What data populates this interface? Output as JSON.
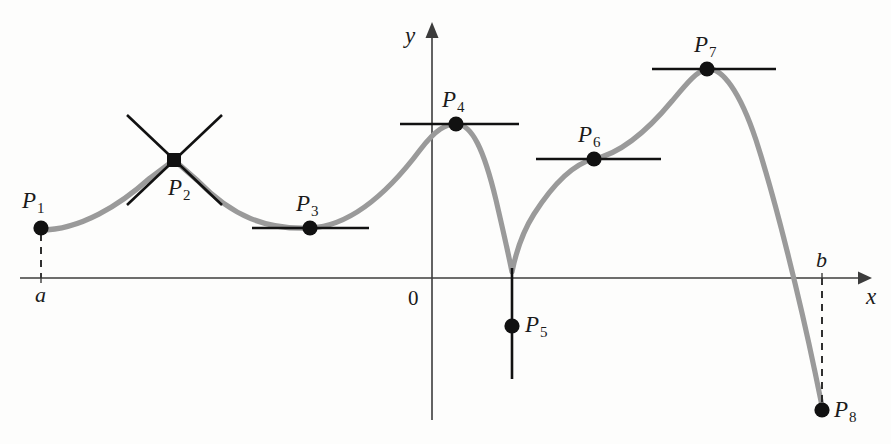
{
  "figure": {
    "background_color": "#fdfdfc",
    "curve_color": "#9a9a9a",
    "axis_color": "#3c3c3c",
    "marker_color": "#111111",
    "tangent_color": "#111111"
  },
  "axes": {
    "x_label": "x",
    "y_label": "y",
    "origin_label": "0",
    "x_axis_y": 278,
    "y_axis_x": 432,
    "left_endpoint_label": "a",
    "right_endpoint_label": "b"
  },
  "points": [
    {
      "label": "P",
      "sub": "1",
      "name": "p1",
      "x": 41,
      "y": 228,
      "kind": "left-endpoint",
      "tangent": "none",
      "label_x": 22,
      "label_y": 189
    },
    {
      "label": "P",
      "sub": "2",
      "name": "p2",
      "x": 174,
      "y": 160,
      "kind": "corner",
      "tangent": "crossing",
      "label_x": 168,
      "label_y": 176
    },
    {
      "label": "P",
      "sub": "3",
      "name": "p3",
      "x": 310,
      "y": 228,
      "kind": "local-minimum",
      "tangent": "horizontal",
      "label_x": 296,
      "label_y": 192
    },
    {
      "label": "P",
      "sub": "4",
      "name": "p4",
      "x": 456,
      "y": 124,
      "kind": "local-maximum",
      "tangent": "horizontal",
      "label_x": 442,
      "label_y": 88
    },
    {
      "label": "P",
      "sub": "5",
      "name": "p5",
      "x": 512,
      "y": 326,
      "kind": "cusp",
      "tangent": "vertical",
      "label_x": 525,
      "label_y": 313
    },
    {
      "label": "P",
      "sub": "6",
      "name": "p6",
      "x": 594,
      "y": 159,
      "kind": "inflection",
      "tangent": "horizontal",
      "label_x": 578,
      "label_y": 123
    },
    {
      "label": "P",
      "sub": "7",
      "name": "p7",
      "x": 707,
      "y": 69,
      "kind": "absolute-maximum",
      "tangent": "horizontal",
      "label_x": 694,
      "label_y": 33
    },
    {
      "label": "P",
      "sub": "8",
      "name": "p8",
      "x": 822,
      "y": 410,
      "kind": "right-endpoint",
      "tangent": "none",
      "label_x": 834,
      "label_y": 398
    }
  ],
  "tangents": {
    "p2_line_a": {
      "x1": 127,
      "y1": 115,
      "x2": 222,
      "y2": 205
    },
    "p2_line_b": {
      "x1": 127,
      "y1": 205,
      "x2": 222,
      "y2": 115
    },
    "p3_line": {
      "x1": 252,
      "y1": 228,
      "x2": 369,
      "y2": 228
    },
    "p4_line": {
      "x1": 400,
      "y1": 124,
      "x2": 519,
      "y2": 124
    },
    "p5_line": {
      "x1": 512,
      "y1": 268,
      "x2": 512,
      "y2": 379
    },
    "p6_line": {
      "x1": 536,
      "y1": 159,
      "x2": 661,
      "y2": 159
    },
    "p7_line": {
      "x1": 652,
      "y1": 69,
      "x2": 776,
      "y2": 69
    }
  },
  "dashed_drops": [
    {
      "name": "a-drop",
      "x": 41,
      "y1": 234,
      "y2": 278
    },
    {
      "name": "b-drop",
      "x": 822,
      "y1": 278,
      "y2": 404
    }
  ],
  "chart_data": {
    "type": "line",
    "xlabel": "x",
    "ylabel": "y",
    "grid": false,
    "legend": "none",
    "annotations": [
      "a",
      "b",
      "0",
      "P1",
      "P2",
      "P3",
      "P4",
      "P5",
      "P6",
      "P7",
      "P8"
    ],
    "x_axis_pixel_y": 278,
    "y_axis_pixel_x": 432,
    "domain_endpoints": {
      "a": 41,
      "b": 822
    },
    "points_pixel": [
      {
        "id": "P1",
        "x": 41,
        "y": 228,
        "feature": "left endpoint, above axis"
      },
      {
        "id": "P2",
        "x": 174,
        "y": 160,
        "feature": "corner; two distinct one-sided tangents crossing"
      },
      {
        "id": "P3",
        "x": 310,
        "y": 228,
        "feature": "local minimum; horizontal tangent"
      },
      {
        "id": "P4",
        "x": 456,
        "y": 124,
        "feature": "local maximum; horizontal tangent"
      },
      {
        "id": "P5",
        "x": 512,
        "y": 326,
        "feature": "cusp below axis; vertical tangent"
      },
      {
        "id": "P6",
        "x": 594,
        "y": 159,
        "feature": "inflection with horizontal tangent"
      },
      {
        "id": "P7",
        "x": 707,
        "y": 69,
        "feature": "absolute maximum; horizontal tangent"
      },
      {
        "id": "P8",
        "x": 822,
        "y": 410,
        "feature": "right endpoint at x = b, below axis"
      }
    ],
    "curve_path_pixel": "M41,230 C80,230 120,205 150,178 L174,160 L198,181 C232,216 266,230 310,228 C352,226 390,190 420,150 C436,129 446,124 456,124 C472,124 484,150 496,200 C506,243 510,262 512,272 C514,262 520,236 534,214 C552,186 572,164 594,159 C622,153 648,130 672,101 C688,82 697,71 707,69 C722,67 740,92 756,140 C776,202 800,300 815,372 L822,406"
  }
}
